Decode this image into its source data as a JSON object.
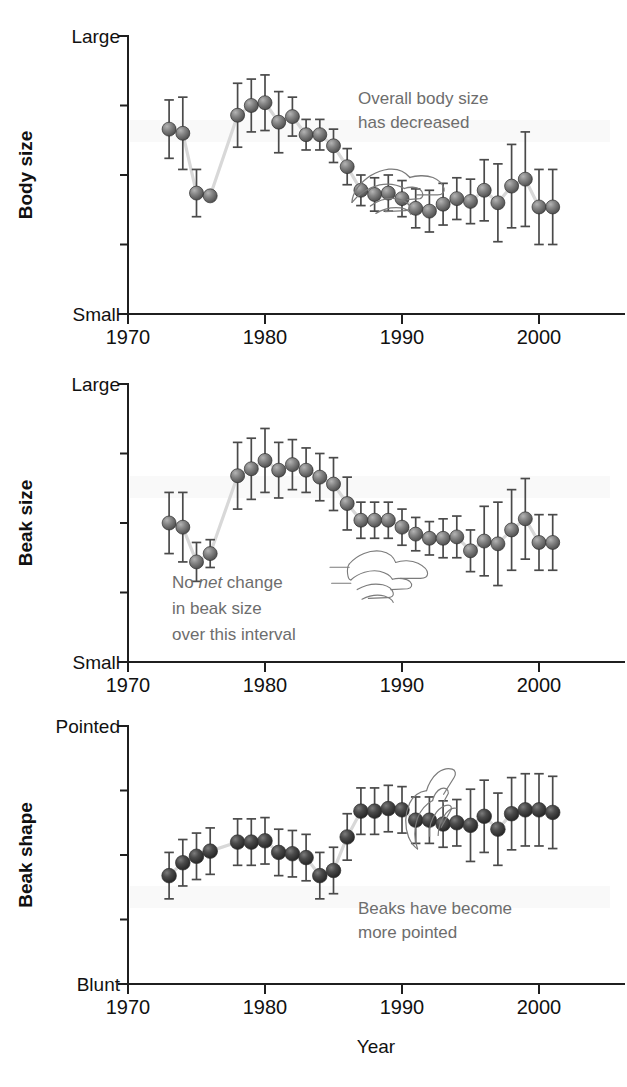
{
  "figure": {
    "background_color": "#ffffff",
    "marker_color_panel1": "#6e6e6e",
    "marker_color_panel2": "#6e6e6e",
    "marker_color_panel3": "#3c3c3c",
    "errorbar_color": "#4a4a4a",
    "connector_color": "#d8d8d8",
    "annotation_color": "#6d6d6d",
    "axis_color": "#1f1f1f",
    "xaxis_title": "Year"
  },
  "chart_data": [
    {
      "type": "scatter",
      "panel_index": 0,
      "title": "",
      "ylabel": "Body size",
      "xlabel": "",
      "y_top_label": "Large",
      "y_bottom_label": "Small",
      "ylim": [
        0,
        100
      ],
      "xlim": [
        1970,
        2002.5
      ],
      "xticks": [
        1970,
        1980,
        1990,
        2000
      ],
      "xticklabels": [
        "1970",
        "1980",
        "1990",
        "2000"
      ],
      "y_minor_ticks": [
        25,
        50,
        75
      ],
      "grid": false,
      "legend": "none",
      "annotation": {
        "lines": [
          "Overall body size",
          "has decreased"
        ],
        "pointer": "pointing-hand"
      },
      "x": [
        1973,
        1974,
        1975,
        1976,
        1978,
        1979,
        1980,
        1981,
        1982,
        1983,
        1984,
        1985,
        1986,
        1987,
        1988,
        1989,
        1990,
        1991,
        1992,
        1993,
        1994,
        1995,
        1996,
        1997,
        1998,
        1999,
        2000,
        2001
      ],
      "values": [
        66.5,
        65.0,
        43.5,
        42.5,
        71.5,
        75.0,
        76.0,
        69.0,
        71.0,
        64.5,
        64.5,
        60.5,
        53.0,
        44.5,
        43.0,
        43.5,
        41.5,
        38.0,
        37.0,
        39.5,
        41.5,
        40.5,
        44.5,
        40.0,
        46.0,
        48.5,
        38.5,
        38.5
      ],
      "errors": [
        10.5,
        13.0,
        8.5,
        1.5,
        11.5,
        9.5,
        10.0,
        11.0,
        7.0,
        5.5,
        5.5,
        6.0,
        6.5,
        5.5,
        6.0,
        6.5,
        6.5,
        7.0,
        7.5,
        7.5,
        7.5,
        8.0,
        11.0,
        14.0,
        15.0,
        17.0,
        13.5,
        13.5
      ]
    },
    {
      "type": "scatter",
      "panel_index": 1,
      "title": "",
      "ylabel": "Beak size",
      "xlabel": "",
      "y_top_label": "Large",
      "y_bottom_label": "Small",
      "ylim": [
        0,
        100
      ],
      "xlim": [
        1970,
        2002.5
      ],
      "xticks": [
        1970,
        1980,
        1990,
        2000
      ],
      "xticklabels": [
        "1970",
        "1980",
        "1990",
        "2000"
      ],
      "y_minor_ticks": [
        25,
        50,
        75
      ],
      "grid": false,
      "legend": "none",
      "annotation": {
        "lines": [
          "No net change",
          "in beak size",
          "over this interval"
        ],
        "italic_word": "net",
        "pointer": "pointing-hand"
      },
      "x": [
        1973,
        1974,
        1975,
        1976,
        1978,
        1979,
        1980,
        1981,
        1982,
        1983,
        1984,
        1985,
        1986,
        1987,
        1988,
        1989,
        1990,
        1991,
        1992,
        1993,
        1994,
        1995,
        1996,
        1997,
        1998,
        1999,
        2000,
        2001
      ],
      "values": [
        50.0,
        48.5,
        36.0,
        39.0,
        67.0,
        69.5,
        72.5,
        69.0,
        71.0,
        69.0,
        66.5,
        64.0,
        57.0,
        51.0,
        51.0,
        51.0,
        48.5,
        46.0,
        44.5,
        44.5,
        45.0,
        40.0,
        43.5,
        42.5,
        47.5,
        51.5,
        43.0,
        43.0
      ],
      "errors": [
        11.0,
        12.5,
        7.0,
        5.0,
        12.0,
        11.0,
        11.5,
        10.0,
        9.0,
        8.0,
        8.5,
        9.5,
        9.5,
        6.5,
        6.5,
        6.5,
        6.5,
        6.0,
        6.0,
        7.0,
        7.5,
        7.5,
        12.5,
        15.0,
        14.5,
        14.5,
        10.0,
        10.0
      ]
    },
    {
      "type": "scatter",
      "panel_index": 2,
      "title": "",
      "ylabel": "Beak shape",
      "xlabel": "Year",
      "y_top_label": "Pointed",
      "y_bottom_label": "Blunt",
      "ylim": [
        0,
        100
      ],
      "xlim": [
        1970,
        2002.5
      ],
      "xticks": [
        1970,
        1980,
        1990,
        2000
      ],
      "xticklabels": [
        "1970",
        "1980",
        "1990",
        "2000"
      ],
      "y_minor_ticks": [
        25,
        50,
        75
      ],
      "grid": false,
      "legend": "none",
      "annotation": {
        "lines": [
          "Beaks have become",
          "more pointed"
        ],
        "pointer": "pointing-hand"
      },
      "x": [
        1973,
        1974,
        1975,
        1976,
        1978,
        1979,
        1980,
        1981,
        1982,
        1983,
        1984,
        1985,
        1986,
        1987,
        1988,
        1989,
        1990,
        1991,
        1992,
        1993,
        1994,
        1995,
        1996,
        1997,
        1998,
        1999,
        2000,
        2001
      ],
      "values": [
        42.0,
        47.0,
        49.5,
        51.5,
        55.0,
        55.0,
        55.5,
        51.0,
        50.5,
        49.0,
        42.0,
        44.0,
        57.0,
        67.0,
        67.0,
        68.0,
        67.5,
        63.5,
        63.5,
        62.0,
        62.5,
        61.5,
        65.0,
        60.0,
        66.0,
        67.5,
        67.5,
        66.5
      ]
    }
  ],
  "panels": [
    {
      "id": "body-size",
      "ylabel": "Body size",
      "y_top_label": "Large",
      "y_bottom_label": "Small",
      "annotation_line1": "Overall body size",
      "annotation_line2": "has decreased",
      "annotation_line3": "",
      "xticklabels": [
        "1970",
        "1980",
        "1990",
        "2000"
      ]
    },
    {
      "id": "beak-size",
      "ylabel": "Beak size",
      "y_top_label": "Large",
      "y_bottom_label": "Small",
      "annotation_line1_a": "No ",
      "annotation_line1_b": "net",
      "annotation_line1_c": " change",
      "annotation_line2": "in beak size",
      "annotation_line3": "over this interval",
      "xticklabels": [
        "1970",
        "1980",
        "1990",
        "2000"
      ]
    },
    {
      "id": "beak-shape",
      "ylabel": "Beak shape",
      "y_top_label": "Pointed",
      "y_bottom_label": "Blunt",
      "annotation_line1": "Beaks have become",
      "annotation_line2": "more pointed",
      "annotation_line3": "",
      "xticklabels": [
        "1970",
        "1980",
        "1990",
        "2000"
      ],
      "xaxis_title": "Year"
    }
  ]
}
